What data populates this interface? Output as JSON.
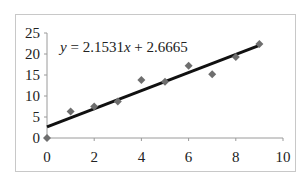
{
  "chart_data": {
    "type": "scatter",
    "title": "",
    "xlabel": "",
    "ylabel": "",
    "xlim": [
      0,
      10
    ],
    "ylim": [
      0,
      25
    ],
    "x_ticks": [
      0,
      2,
      4,
      6,
      8,
      10
    ],
    "y_ticks": [
      0,
      5,
      10,
      15,
      20,
      25
    ],
    "x_tick_labels": [
      "0",
      "2",
      "4",
      "6",
      "8",
      "10"
    ],
    "y_tick_labels": [
      "0",
      "5",
      "10",
      "15",
      "20",
      "25"
    ],
    "grid": false,
    "legend": "none",
    "series": [
      {
        "name": "data",
        "marker": "diamond",
        "color": "#6e6e6e",
        "x": [
          0,
          1,
          2,
          3,
          4,
          5,
          6,
          7,
          8,
          9
        ],
        "y": [
          0,
          6.3,
          7.5,
          8.7,
          13.8,
          13.4,
          17.2,
          15.2,
          19.3,
          22.4
        ]
      },
      {
        "name": "linear-trendline",
        "type": "line",
        "color": "#111111",
        "slope": 2.1531,
        "intercept": 2.6665,
        "x_range": [
          0,
          9
        ]
      }
    ],
    "annotations": [
      {
        "text_parts": [
          "y",
          " = 2.1531",
          "x",
          " + 2.6665"
        ],
        "position": "top-left"
      }
    ]
  }
}
